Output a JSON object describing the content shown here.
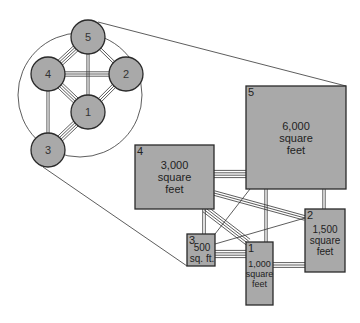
{
  "colors": {
    "fill": "#a9a9a9",
    "stroke": "#2a2a2a",
    "line": "#333333",
    "background": "#ffffff"
  },
  "bubble_diagram": {
    "outline_circle": {
      "cx": 80,
      "cy": 95,
      "r": 62
    },
    "nodes": [
      {
        "id": "5",
        "label": "5",
        "cx": 88,
        "cy": 37,
        "r": 17
      },
      {
        "id": "4",
        "label": "4",
        "cx": 48,
        "cy": 74,
        "r": 17
      },
      {
        "id": "2",
        "label": "2",
        "cx": 126,
        "cy": 74,
        "r": 17
      },
      {
        "id": "1",
        "label": "1",
        "cx": 88,
        "cy": 112,
        "r": 17
      },
      {
        "id": "3",
        "label": "3",
        "cx": 48,
        "cy": 150,
        "r": 17
      }
    ],
    "connections": [
      {
        "from": "5",
        "to": "4",
        "lines": 4
      },
      {
        "from": "5",
        "to": "2",
        "lines": 2
      },
      {
        "from": "5",
        "to": "1",
        "lines": 2
      },
      {
        "from": "4",
        "to": "2",
        "lines": 3
      },
      {
        "from": "4",
        "to": "1",
        "lines": 4
      },
      {
        "from": "2",
        "to": "1",
        "lines": 3
      },
      {
        "from": "4",
        "to": "3",
        "lines": 2
      },
      {
        "from": "3",
        "to": "1",
        "lines": 4
      }
    ]
  },
  "projection_lines": [
    {
      "x1": 98,
      "y1": 22,
      "x2": 346,
      "y2": 86
    },
    {
      "x1": 43,
      "y1": 167,
      "x2": 187,
      "y2": 266
    }
  ],
  "block_diagram": {
    "rooms": [
      {
        "id": "5",
        "number": "5",
        "area_lines": [
          "6,000",
          "square",
          "feet"
        ],
        "x": 246,
        "y": 86,
        "w": 100,
        "h": 103,
        "font": 11
      },
      {
        "id": "4",
        "number": "4",
        "area_lines": [
          "3,000",
          "square",
          "feet"
        ],
        "x": 135,
        "y": 145,
        "w": 79,
        "h": 64,
        "font": 11
      },
      {
        "id": "2",
        "number": "2",
        "area_lines": [
          "1,500",
          "square",
          "feet"
        ],
        "x": 305,
        "y": 209,
        "w": 40,
        "h": 63,
        "font": 10
      },
      {
        "id": "3",
        "number": "3",
        "area_lines": [
          "500",
          "sq. ft."
        ],
        "x": 187,
        "y": 234,
        "w": 28,
        "h": 32,
        "font": 10
      },
      {
        "id": "1",
        "number": "1",
        "area_lines": [
          "1,000",
          "square",
          "feet"
        ],
        "x": 246,
        "y": 242,
        "w": 27,
        "h": 63,
        "font": 9
      }
    ],
    "connections": [
      {
        "from": "4",
        "to": "5",
        "lines": 4
      },
      {
        "from": "4",
        "to": "2",
        "lines": 3
      },
      {
        "from": "4",
        "to": "1",
        "lines": 4
      },
      {
        "from": "4",
        "to": "3",
        "lines": 2
      },
      {
        "from": "5",
        "to": "1",
        "lines": 2
      },
      {
        "from": "5",
        "to": "2",
        "lines": 2
      },
      {
        "from": "5",
        "to": "3",
        "lines": 1
      },
      {
        "from": "3",
        "to": "2",
        "lines": 1
      },
      {
        "from": "3",
        "to": "1",
        "lines": 4
      },
      {
        "from": "1",
        "to": "2",
        "lines": 3
      }
    ]
  }
}
